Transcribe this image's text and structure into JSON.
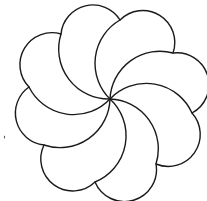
{
  "figure": {
    "stroke_color": "#1a1a1a",
    "background": "#ffffff",
    "center": [
      110,
      99
    ],
    "petal_count": 8,
    "cusps": [
      [
        61,
        34
      ],
      [
        120,
        20
      ],
      [
        173,
        53
      ],
      [
        192,
        113
      ],
      [
        156,
        164
      ],
      [
        95,
        182
      ],
      [
        44,
        145
      ],
      [
        29,
        87
      ]
    ]
  }
}
